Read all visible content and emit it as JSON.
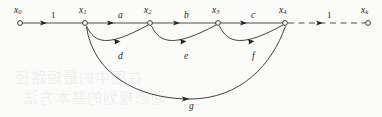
{
  "figure": {
    "caption": "",
    "background_color": "#fbfbfa",
    "ink_color": "#232323",
    "width": 382,
    "height": 117
  },
  "graph": {
    "type": "directed-graph",
    "baseline_y": 23,
    "nodes": [
      {
        "id": "x0",
        "label": "x",
        "subscript": "0",
        "x": 20,
        "y": 23,
        "label_x": 14,
        "label_y": 6
      },
      {
        "id": "x1",
        "label": "x",
        "subscript": "1",
        "x": 85,
        "y": 23,
        "label_x": 79,
        "label_y": 6
      },
      {
        "id": "x2",
        "label": "x",
        "subscript": "2",
        "x": 150,
        "y": 23,
        "label_x": 144,
        "label_y": 6
      },
      {
        "id": "x3",
        "label": "x",
        "subscript": "3",
        "x": 218,
        "y": 23,
        "label_x": 212,
        "label_y": 6
      },
      {
        "id": "x4",
        "label": "x",
        "subscript": "4",
        "x": 285,
        "y": 23,
        "label_x": 279,
        "label_y": 6
      },
      {
        "id": "xk",
        "label": "x",
        "subscript": "k",
        "x": 368,
        "y": 23,
        "label_x": 361,
        "label_y": 6
      }
    ],
    "straight_edges": [
      {
        "id": "e-x0-x1",
        "from": "x0",
        "to": "x1",
        "label": "1",
        "style": "solid",
        "label_x": 51,
        "label_y": 11
      },
      {
        "id": "e-x1-x2",
        "from": "x1",
        "to": "x2",
        "label": "a",
        "style": "solid",
        "label_x": 118,
        "label_y": 11
      },
      {
        "id": "e-x2-x3",
        "from": "x2",
        "to": "x3",
        "label": "b",
        "style": "solid",
        "label_x": 184,
        "label_y": 11
      },
      {
        "id": "e-x3-x4",
        "from": "x3",
        "to": "x4",
        "label": "c",
        "style": "solid",
        "label_x": 251,
        "label_y": 11
      },
      {
        "id": "e-x4-xk",
        "from": "x4",
        "to": "xk",
        "label": "1",
        "style": "dashed",
        "label_x": 327,
        "label_y": 11
      }
    ],
    "arc_edges": [
      {
        "id": "arc-d",
        "from": "x1",
        "to": "x2",
        "label": "d",
        "label_x": 118,
        "label_y": 52
      },
      {
        "id": "arc-e",
        "from": "x2",
        "to": "x3",
        "label": "e",
        "label_x": 184,
        "label_y": 52
      },
      {
        "id": "arc-f",
        "from": "x3",
        "to": "x4",
        "label": "f",
        "label_x": 252,
        "label_y": 52
      },
      {
        "id": "arc-g",
        "from": "x1",
        "to": "x4",
        "label": "g",
        "label_x": 189,
        "label_y": 102
      }
    ]
  },
  "bleed_through": {
    "line1": "在图中的最短路径",
    "line2": "动态规划的基本方法"
  }
}
